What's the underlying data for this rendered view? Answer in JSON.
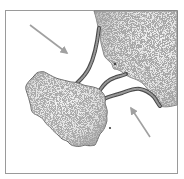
{
  "figure": {
    "frame": {
      "left": 5,
      "top": 10,
      "right": 178,
      "bottom": 174,
      "color": "#9a9a9a"
    },
    "colors": {
      "land_fill": "#e6e6e6",
      "land_edge": "#5a5a5a",
      "stipple": "#7a7a7a",
      "spit_fill": "#8a8a8a",
      "spit_edge": "#4a4a4a",
      "arrow": "#a0a0a0",
      "background": "#ffffff"
    },
    "elements": {
      "mainland": {
        "label": "mainland"
      },
      "island": {
        "label": "island"
      },
      "spit_upper": {
        "label": "spit"
      },
      "spit_middle": {
        "label": "spit"
      },
      "spit_lower": {
        "label": "spit"
      },
      "arrow_left": {
        "label": "wave direction",
        "from": [
          30,
          25
        ],
        "to": [
          67,
          53
        ]
      },
      "arrow_right": {
        "label": "wave direction",
        "from": [
          150,
          137
        ],
        "to": [
          130,
          106
        ]
      }
    }
  }
}
